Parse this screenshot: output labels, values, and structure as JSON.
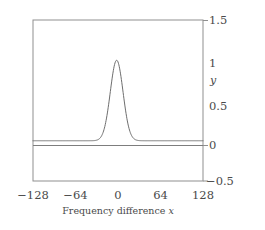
{
  "figure": {
    "background_color": "#ffffff",
    "frame_color": "#8a8a8a",
    "curve_color": "#6e6e6e",
    "text_color": "#4a4a4a"
  },
  "axes": {
    "y_title": "y",
    "x_title_prefix": "Frequency difference ",
    "x_title_var": "x",
    "x_title_full": "Frequency difference x"
  },
  "chart_data": {
    "type": "line",
    "title": "",
    "subtitle": "",
    "xlabel": "Frequency difference x",
    "ylabel": "y",
    "xlim": [
      -128,
      128
    ],
    "ylim": [
      -0.5,
      1.5
    ],
    "xticks": [
      -128,
      -64,
      0,
      64,
      128
    ],
    "xticklabels": [
      "−128",
      "−64",
      "0",
      "64",
      "128"
    ],
    "yticks": [
      1.5,
      1,
      0.5,
      0,
      -0.5
    ],
    "yticklabels": [
      "1.5",
      "1",
      "0.5",
      "0",
      "−0.5"
    ],
    "ytick_marks_drawn": [
      1.5,
      0,
      -0.5
    ],
    "grid": false,
    "legend": null,
    "frame": "box",
    "series": [
      {
        "name": "peak",
        "shape": "gaussian",
        "amplitude": 1.0,
        "center": -2,
        "sigma": 9.6,
        "fwhm": 22.6,
        "baseline": 0,
        "note": "narrow symmetric peak rising from y=0 to y=1 near x=0",
        "x": [
          -128,
          -110,
          -90,
          -70,
          -50,
          -40,
          -32,
          -26,
          -22,
          -18,
          -15,
          -12,
          -9,
          -6,
          -4,
          -2,
          0,
          2,
          4,
          6,
          9,
          12,
          15,
          18,
          22,
          26,
          32,
          40,
          50,
          70,
          90,
          110,
          128
        ],
        "y": [
          0,
          0,
          0,
          0,
          0.001,
          0.005,
          0.017,
          0.047,
          0.09,
          0.16,
          0.25,
          0.37,
          0.51,
          0.68,
          0.83,
          0.94,
          0.98,
          1.0,
          0.96,
          0.88,
          0.72,
          0.55,
          0.39,
          0.26,
          0.14,
          0.07,
          0.02,
          0.004,
          0.001,
          0,
          0,
          0,
          0
        ]
      }
    ]
  },
  "y_tick_items": [
    {
      "label": "1.5",
      "value": 1.5
    },
    {
      "label": "1",
      "value": 1
    },
    {
      "label": "0.5",
      "value": 0.5
    },
    {
      "label": "0",
      "value": 0
    },
    {
      "label": "−0.5",
      "value": -0.5
    }
  ],
  "x_tick_items": [
    {
      "label": "−128",
      "value": -128
    },
    {
      "label": "−64",
      "value": -64
    },
    {
      "label": "0",
      "value": 0
    },
    {
      "label": "64",
      "value": 64
    },
    {
      "label": "128",
      "value": 128
    }
  ]
}
